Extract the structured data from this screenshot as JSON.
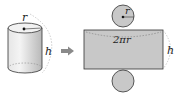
{
  "diagram": {
    "cylinder": {
      "radius_label": "r",
      "height_label": "h"
    },
    "arrow": {
      "icon": "right-arrow-icon"
    },
    "net": {
      "top_circle_radius_label": "r",
      "rectangle_width_label": "2πr",
      "rectangle_height_label": "h"
    },
    "colors": {
      "fill": "#c8c8c8",
      "fill_light": "#e4e4e4",
      "stroke": "#333333",
      "dashed": "#999999",
      "arrow": "#8a8a8a"
    }
  }
}
